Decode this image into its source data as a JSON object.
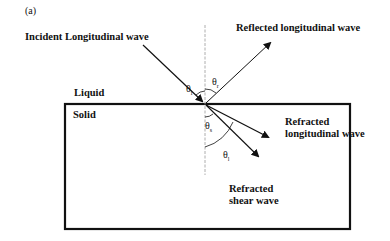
{
  "figure_label": "(a)",
  "labels": {
    "incident": "Incident Longitudinal wave",
    "reflected": "Reflected longitudinal wave",
    "liquid": "Liquid",
    "solid": "Solid",
    "refracted_long_1": "Refracted",
    "refracted_long_2": "longitudinal wave",
    "refracted_shear_1": "Refracted",
    "refracted_shear_2": "shear wave"
  },
  "angles": {
    "incident": {
      "symbol": "θ",
      "sub": "i"
    },
    "reflected": {
      "symbol": "θ",
      "sub": "r"
    },
    "shear": {
      "symbol": "θ",
      "sub": "s"
    },
    "longitudinal": {
      "symbol": "θ",
      "sub": "l"
    }
  },
  "colors": {
    "line": "#111111",
    "normal": "#999999",
    "background": "#ffffff"
  }
}
